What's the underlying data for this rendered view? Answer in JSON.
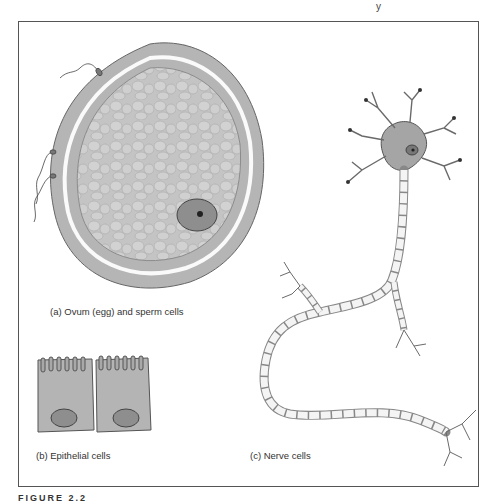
{
  "page": {
    "header_fragment": "y",
    "figure_label": "FIGURE 2.2"
  },
  "figure": {
    "panels": [
      {
        "id": "a",
        "caption": "(a)  Ovum (egg) and sperm cells",
        "subject": "ovum with sperm cells attached"
      },
      {
        "id": "b",
        "caption": "(b)  Epithelial cells",
        "subject": "two columnar epithelial cells with microvilli"
      },
      {
        "id": "c",
        "caption": "(c)  Nerve cells",
        "subject": "neuron with dendrites and myelinated axon"
      }
    ]
  },
  "colors": {
    "cell_fill": "#b8b8b8",
    "cell_dark": "#8a8a8a",
    "outline": "#555555",
    "frame": "#555555"
  }
}
